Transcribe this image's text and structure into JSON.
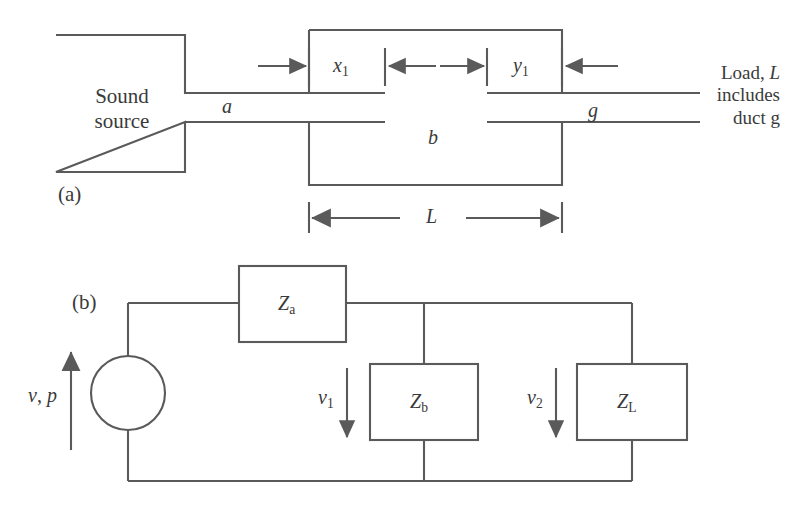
{
  "figure": {
    "panels": [
      {
        "id": "a",
        "label": "(a)"
      },
      {
        "id": "b",
        "label": "(b)"
      }
    ]
  },
  "panel_a": {
    "source_box": {
      "line1": "Sound",
      "line2": "source"
    },
    "duct_inlet_label": "a",
    "duct_outlet_label": "g",
    "chamber_label": "b",
    "dim_x1": {
      "base": "x",
      "sub": "1"
    },
    "dim_y1": {
      "base": "y",
      "sub": "1"
    },
    "dim_length": "L",
    "load_note": {
      "line1_prefix": "Load, ",
      "line1_italic": "L",
      "line2": "includes",
      "line3": "duct g"
    }
  },
  "panel_b": {
    "source_label": {
      "v": "v",
      "comma": ", ",
      "p": "p"
    },
    "impedance_za": {
      "base": "Z",
      "sub": "a"
    },
    "impedance_zb": {
      "base": "Z",
      "sub": "b"
    },
    "impedance_zl": {
      "base": "Z",
      "sub": "L"
    },
    "flow_v1": {
      "base": "v",
      "sub": "1"
    },
    "flow_v2": {
      "base": "v",
      "sub": "2"
    }
  },
  "style": {
    "stroke": "#5a5a5a",
    "text": "#3a3a3a",
    "background": "#ffffff"
  }
}
